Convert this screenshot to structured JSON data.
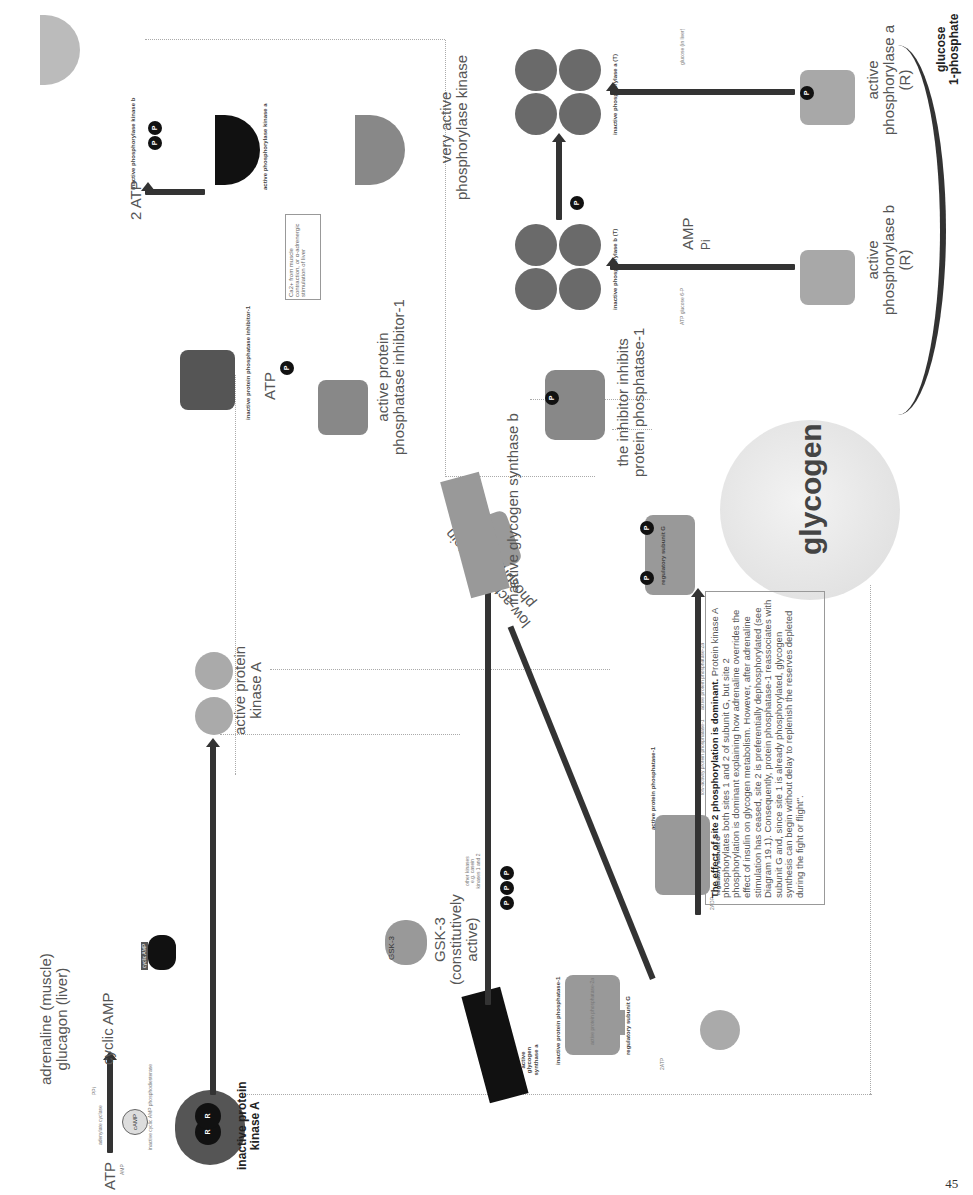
{
  "page": {
    "number": "45"
  },
  "signal": {
    "hormone_line1": "adrenaline (muscle)",
    "hormone_line2": "glucagon (liver)",
    "atp": "ATP",
    "enzyme": "adenylate cyclase",
    "ppi": "PPi",
    "product": "cyclic AMP",
    "amp": "AMP",
    "pde_label": "inactive cyclic AMP phosphodiesterase",
    "pde_icon": "cAMP"
  },
  "pka": {
    "inactive_line1": "inactive protein",
    "inactive_line2": "kinase A",
    "camp_badge": "cyclic AMP",
    "r_label": "R",
    "c_label": "C",
    "active_line1": "active protein",
    "active_line2": "kinase A"
  },
  "inhibitor": {
    "inactive_label": "inactive protein phosphatase inhibitor-1",
    "atp": "ATP",
    "adp": "ADP",
    "active_line1": "active protein",
    "active_line2": "phosphatase inhibitor-1",
    "low_activity_line1": "low-activity protein",
    "low_activity_line2": "phosphatase-1",
    "inhibits_line1": "the inhibitor inhibits",
    "inhibits_line2": "protein phosphatase-1"
  },
  "phosphorylase_kinase": {
    "inactive_label": "inactive phosphorylase kinase b",
    "atp": "2 ATP",
    "adp": "2 ADP",
    "active_label": "active phosphorylase kinase a",
    "ca": "Ca2+",
    "ca_note": "Ca2+ from muscle contraction, or α-adrenergic stimulation of liver",
    "very_active_line1": "very active",
    "very_active_line2": "phosphorylase kinase",
    "subunits": [
      "α",
      "β",
      "γ",
      "δ"
    ]
  },
  "phosphorylase": {
    "inactive_b": "inactive phosphorylase b (T)",
    "inactive_a": "inactive phosphorylase a (T)",
    "active_b_line1": "active",
    "active_b_line2": "phosphorylase b",
    "active_b_line3": "(R)",
    "active_a_line1": "active",
    "active_a_line2": "phosphorylase a",
    "active_a_line3": "(R)",
    "amp": "AMP",
    "pi": "Pi",
    "inhibitors_b": "ATP glucose 6-P",
    "inhibitor_a": "glucose (in liver)",
    "atp": "ATP",
    "adp": "ADP",
    "glycogen": "glycogen",
    "product_line1": "glucose",
    "product_line2": "1-phosphate"
  },
  "synthase": {
    "gsk_badge": "GSK-3",
    "gsk_line1": "GSK-3",
    "gsk_line2": "(constitutively",
    "gsk_line3": "active)",
    "active_label": "active glycogen synthase a",
    "other_kinases": "other kinases e.g. casein kinases 1 and 2",
    "inactive_label": "inactive glycogen synthase b",
    "atp": "ATP",
    "adp": "ADP"
  },
  "pp1": {
    "inactive_label": "inactive protein phosphatase-1",
    "active_label": "active protein phosphatase-1",
    "regulatory": "regulatory subunit G",
    "glycogen": "glycogen",
    "pp2a_label": "active protein phosphatase-2a",
    "low_activity": "low-activity protein phosphatase-1",
    "two_atp": "2ATP",
    "two_adp": "2ADP",
    "site1": "1",
    "site2": "2",
    "on": "On"
  },
  "note": {
    "title": "The effect of site 2 phosphorylation is dominant.",
    "body": "Protein kinase A phosphorylates both sites 1 and 2 of subunit G, but site 2 phosphorylation is dominant explaining how adrenaline overrides the effect of insulin on glycogen metabolism. However, after adrenaline stimulation has ceased, site 2 is preferentially dephosphorylated (see Diagram 19.1). Consequently, protein phosphatase-1 reassociates with subunit G and, since site 1 is already phosphorylated, glycogen synthesis can begin without delay to replenish the reserves depleted during the fight or flight\"."
  },
  "common": {
    "p": "P"
  }
}
